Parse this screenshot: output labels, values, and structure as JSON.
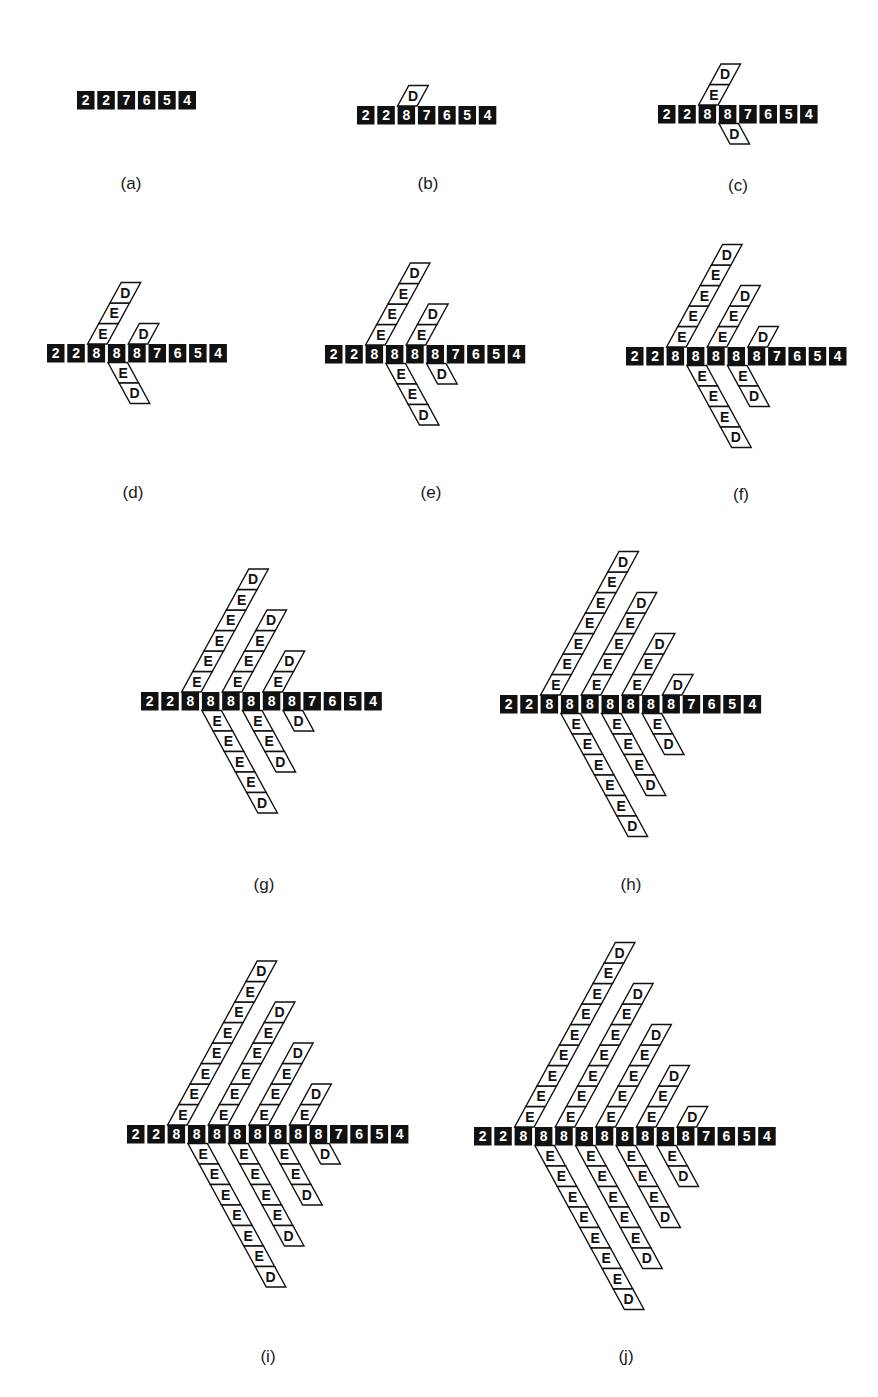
{
  "figure": {
    "background": "#ffffff",
    "colors": {
      "cell_fill": "#111111",
      "cell_text": "#ffffff",
      "branch_stroke": "#111111",
      "branch_fill": "#ffffff",
      "branch_text": "#111111",
      "label_text": "#1a1a1a"
    },
    "geometry": {
      "pitch": 20.3,
      "cell_w": 17.5,
      "cell_h": 18.5,
      "branch_h": 20.5,
      "branch_dx": 11.2
    },
    "panels": [
      {
        "id": "a",
        "label": "(a)",
        "label_pos": [
          131,
          174
        ],
        "row_origin": [
          77,
          91
        ],
        "cells": [
          "2",
          "2",
          "7",
          "6",
          "5",
          "4"
        ],
        "branches": []
      },
      {
        "id": "b",
        "label": "(b)",
        "label_pos": [
          428,
          174
        ],
        "row_origin": [
          357,
          106
        ],
        "cells": [
          "2",
          "2",
          "8",
          "7",
          "6",
          "5",
          "4"
        ],
        "branches": [
          {
            "cell": 2,
            "dir": "up",
            "letters": [
              "D"
            ]
          }
        ]
      },
      {
        "id": "c",
        "label": "(c)",
        "label_pos": [
          738,
          176
        ],
        "row_origin": [
          658,
          105
        ],
        "cells": [
          "2",
          "2",
          "8",
          "8",
          "7",
          "6",
          "5",
          "4"
        ],
        "branches": [
          {
            "cell": 2,
            "dir": "up",
            "letters": [
              "E",
              "D"
            ]
          },
          {
            "cell": 3,
            "dir": "down",
            "letters": [
              "D"
            ]
          }
        ]
      },
      {
        "id": "d",
        "label": "(d)",
        "label_pos": [
          133,
          483
        ],
        "row_origin": [
          47,
          344
        ],
        "cells": [
          "2",
          "2",
          "8",
          "8",
          "8",
          "7",
          "6",
          "5",
          "4"
        ],
        "branches": [
          {
            "cell": 2,
            "dir": "up",
            "letters": [
              "E",
              "E",
              "D"
            ]
          },
          {
            "cell": 4,
            "dir": "up",
            "letters": [
              "D"
            ]
          },
          {
            "cell": 3,
            "dir": "down",
            "letters": [
              "E",
              "D"
            ]
          }
        ]
      },
      {
        "id": "e",
        "label": "(e)",
        "label_pos": [
          431,
          483
        ],
        "row_origin": [
          325,
          345
        ],
        "cells": [
          "2",
          "2",
          "8",
          "8",
          "8",
          "8",
          "7",
          "6",
          "5",
          "4"
        ],
        "branches": [
          {
            "cell": 2,
            "dir": "up",
            "letters": [
              "E",
              "E",
              "E",
              "D"
            ]
          },
          {
            "cell": 4,
            "dir": "up",
            "letters": [
              "E",
              "D"
            ]
          },
          {
            "cell": 3,
            "dir": "down",
            "letters": [
              "E",
              "E",
              "D"
            ]
          },
          {
            "cell": 5,
            "dir": "down",
            "letters": [
              "D"
            ]
          }
        ]
      },
      {
        "id": "f",
        "label": "(f)",
        "label_pos": [
          741,
          485
        ],
        "row_origin": [
          626,
          347
        ],
        "cells": [
          "2",
          "2",
          "8",
          "8",
          "8",
          "8",
          "8",
          "7",
          "6",
          "5",
          "4"
        ],
        "branches": [
          {
            "cell": 2,
            "dir": "up",
            "letters": [
              "E",
              "E",
              "E",
              "E",
              "D"
            ]
          },
          {
            "cell": 4,
            "dir": "up",
            "letters": [
              "E",
              "E",
              "D"
            ]
          },
          {
            "cell": 6,
            "dir": "up",
            "letters": [
              "D"
            ]
          },
          {
            "cell": 3,
            "dir": "down",
            "letters": [
              "E",
              "E",
              "E",
              "D"
            ]
          },
          {
            "cell": 5,
            "dir": "down",
            "letters": [
              "E",
              "D"
            ]
          }
        ]
      },
      {
        "id": "g",
        "label": "(g)",
        "label_pos": [
          264,
          875
        ],
        "row_origin": [
          141,
          692
        ],
        "cells": [
          "2",
          "2",
          "8",
          "8",
          "8",
          "8",
          "8",
          "8",
          "7",
          "6",
          "5",
          "4"
        ],
        "branches": [
          {
            "cell": 2,
            "dir": "up",
            "letters": [
              "E",
              "E",
              "E",
              "E",
              "E",
              "D"
            ]
          },
          {
            "cell": 4,
            "dir": "up",
            "letters": [
              "E",
              "E",
              "E",
              "D"
            ]
          },
          {
            "cell": 6,
            "dir": "up",
            "letters": [
              "E",
              "D"
            ]
          },
          {
            "cell": 3,
            "dir": "down",
            "letters": [
              "E",
              "E",
              "E",
              "E",
              "D"
            ]
          },
          {
            "cell": 5,
            "dir": "down",
            "letters": [
              "E",
              "E",
              "D"
            ]
          },
          {
            "cell": 7,
            "dir": "down",
            "letters": [
              "D"
            ]
          }
        ]
      },
      {
        "id": "h",
        "label": "(h)",
        "label_pos": [
          631,
          875
        ],
        "row_origin": [
          500,
          695
        ],
        "cells": [
          "2",
          "2",
          "8",
          "8",
          "8",
          "8",
          "8",
          "8",
          "8",
          "7",
          "6",
          "5",
          "4"
        ],
        "branches": [
          {
            "cell": 2,
            "dir": "up",
            "letters": [
              "E",
              "E",
              "E",
              "E",
              "E",
              "E",
              "D"
            ]
          },
          {
            "cell": 4,
            "dir": "up",
            "letters": [
              "E",
              "E",
              "E",
              "E",
              "D"
            ]
          },
          {
            "cell": 6,
            "dir": "up",
            "letters": [
              "E",
              "E",
              "D"
            ]
          },
          {
            "cell": 8,
            "dir": "up",
            "letters": [
              "D"
            ]
          },
          {
            "cell": 3,
            "dir": "down",
            "letters": [
              "E",
              "E",
              "E",
              "E",
              "E",
              "D"
            ]
          },
          {
            "cell": 5,
            "dir": "down",
            "letters": [
              "E",
              "E",
              "E",
              "D"
            ]
          },
          {
            "cell": 7,
            "dir": "down",
            "letters": [
              "E",
              "D"
            ]
          }
        ]
      },
      {
        "id": "i",
        "label": "(i)",
        "label_pos": [
          268,
          1347
        ],
        "row_origin": [
          127,
          1125
        ],
        "cells": [
          "2",
          "2",
          "8",
          "8",
          "8",
          "8",
          "8",
          "8",
          "8",
          "8",
          "7",
          "6",
          "5",
          "4"
        ],
        "branches": [
          {
            "cell": 2,
            "dir": "up",
            "letters": [
              "E",
              "E",
              "E",
              "E",
              "E",
              "E",
              "E",
              "D"
            ]
          },
          {
            "cell": 4,
            "dir": "up",
            "letters": [
              "E",
              "E",
              "E",
              "E",
              "E",
              "D"
            ]
          },
          {
            "cell": 6,
            "dir": "up",
            "letters": [
              "E",
              "E",
              "E",
              "D"
            ]
          },
          {
            "cell": 8,
            "dir": "up",
            "letters": [
              "E",
              "D"
            ]
          },
          {
            "cell": 3,
            "dir": "down",
            "letters": [
              "E",
              "E",
              "E",
              "E",
              "E",
              "E",
              "D"
            ]
          },
          {
            "cell": 5,
            "dir": "down",
            "letters": [
              "E",
              "E",
              "E",
              "E",
              "D"
            ]
          },
          {
            "cell": 7,
            "dir": "down",
            "letters": [
              "E",
              "E",
              "D"
            ]
          },
          {
            "cell": 9,
            "dir": "down",
            "letters": [
              "D"
            ]
          }
        ]
      },
      {
        "id": "j",
        "label": "(j)",
        "label_pos": [
          626,
          1347
        ],
        "row_origin": [
          474,
          1127
        ],
        "cells": [
          "2",
          "2",
          "8",
          "8",
          "8",
          "8",
          "8",
          "8",
          "8",
          "8",
          "8",
          "7",
          "6",
          "5",
          "4"
        ],
        "branches": [
          {
            "cell": 2,
            "dir": "up",
            "letters": [
              "E",
              "E",
              "E",
              "E",
              "E",
              "E",
              "E",
              "E",
              "D"
            ]
          },
          {
            "cell": 4,
            "dir": "up",
            "letters": [
              "E",
              "E",
              "E",
              "E",
              "E",
              "E",
              "D"
            ]
          },
          {
            "cell": 6,
            "dir": "up",
            "letters": [
              "E",
              "E",
              "E",
              "E",
              "D"
            ]
          },
          {
            "cell": 8,
            "dir": "up",
            "letters": [
              "E",
              "E",
              "D"
            ]
          },
          {
            "cell": 10,
            "dir": "up",
            "letters": [
              "D"
            ]
          },
          {
            "cell": 3,
            "dir": "down",
            "letters": [
              "E",
              "E",
              "E",
              "E",
              "E",
              "E",
              "E",
              "D"
            ]
          },
          {
            "cell": 5,
            "dir": "down",
            "letters": [
              "E",
              "E",
              "E",
              "E",
              "E",
              "D"
            ]
          },
          {
            "cell": 7,
            "dir": "down",
            "letters": [
              "E",
              "E",
              "E",
              "D"
            ]
          },
          {
            "cell": 9,
            "dir": "down",
            "letters": [
              "E",
              "D"
            ]
          }
        ]
      }
    ]
  }
}
